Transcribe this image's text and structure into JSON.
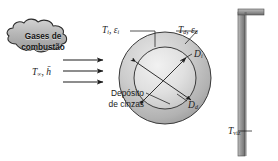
{
  "figure": {
    "language": "pt-BR",
    "background_color": "#ffffff",
    "line_color": "#1c1c1c"
  },
  "cloud": {
    "name": "combustion-gases-cloud",
    "line1": "Gases de",
    "line2": "combustão",
    "fill_color": "#b4b4b4",
    "edge_color": "#2b2b2b"
  },
  "labels": {
    "free_stream": {
      "symbol": "T",
      "subscript": "∞",
      "separator": ",",
      "symbol2": "h̄",
      "text": "T∞, h̄"
    },
    "flame_side": {
      "temperature": "T",
      "temperature_sub": "f",
      "emissivity": "ε",
      "emissivity_sub": "f",
      "text": "Tf, εf"
    },
    "deposit_side": {
      "temperature": "T",
      "temperature_sub": "d",
      "emissivity": "ε",
      "emissivity_sub": "d",
      "text": "Td, εd"
    },
    "inner_diameter": {
      "symbol": "D",
      "subscript": "i",
      "text": "Di"
    },
    "deposit_diameter": {
      "symbol": "D",
      "subscript": "d",
      "text": "Dd"
    },
    "ash_deposit": {
      "line1": "Depósito",
      "line2": "de cinzas"
    },
    "surroundings": {
      "symbol": "T",
      "subscript": "viz",
      "text": "Tviz"
    }
  },
  "flow_arrows": {
    "name": "gas-flow-arrows",
    "count": 3,
    "direction": "right"
  },
  "tube": {
    "outer_diameter_px": 92,
    "inner_diameter_px": 62,
    "center_x": 165,
    "center_y": 78,
    "deposit_fill": "#c9c9c9",
    "core_fill": "#dedede"
  },
  "wall": {
    "name": "surrounding-wall",
    "fill_color": "#8e8e8e",
    "orientation": "vertical-with-top-flange"
  }
}
